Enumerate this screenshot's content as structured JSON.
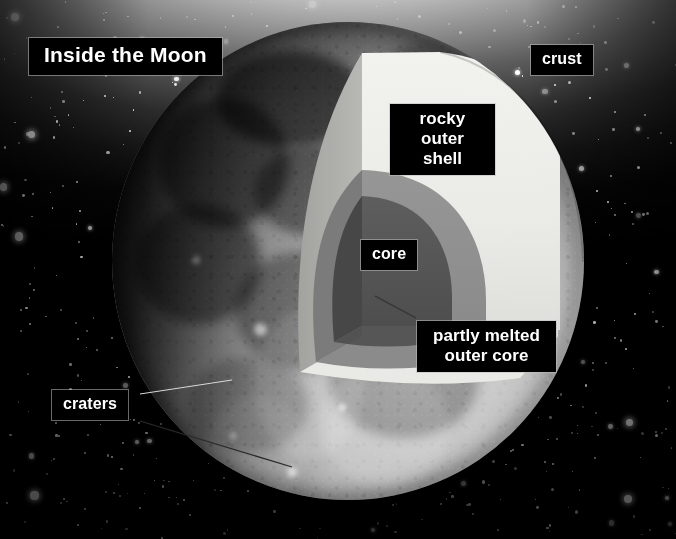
{
  "scene": {
    "width": 676,
    "height": 539,
    "background": "#000000",
    "subject": "moon-cutaway-diagram"
  },
  "title": {
    "text": "Inside the Moon"
  },
  "labels": [
    {
      "id": "crust",
      "text": "crust"
    },
    {
      "id": "shell",
      "text": "rocky outer shell"
    },
    {
      "id": "core",
      "text": "core"
    },
    {
      "id": "outer_core",
      "text": "partly melted outer core"
    },
    {
      "id": "craters",
      "text": "craters"
    }
  ],
  "layers": {
    "crust": {
      "name": "crust",
      "color": "#b9b9b9"
    },
    "rocky_shell": {
      "name": "rocky outer shell",
      "color": "#ebebe7"
    },
    "outer_core": {
      "name": "partly melted outer core",
      "color": "#8d8d8d"
    },
    "core": {
      "name": "core",
      "color": "#565656"
    }
  },
  "colors": {
    "label_background": "#000000",
    "label_text": "#ffffff",
    "label_border": "#bebebe",
    "shell_light": "#ececea",
    "shell_face": "#b4b4b0",
    "mantle_light": "#8f8f8f",
    "mantle_face": "#7c7c7c",
    "core_light": "#585858",
    "core_face": "#4b4b4b",
    "bottom_face": "#e8e8e4",
    "star": "#ffffff",
    "glow": "#f2f2f2"
  },
  "icons": {
    "leader_line": "leader-line-icon",
    "moon": "moon-icon"
  }
}
